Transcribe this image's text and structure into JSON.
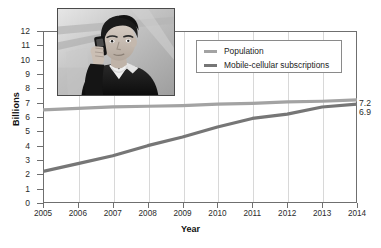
{
  "chart_data": {
    "type": "line",
    "title": "",
    "xlabel": "Year",
    "ylabel": "Billions",
    "x": [
      2005,
      2006,
      2007,
      2008,
      2009,
      2010,
      2011,
      2012,
      2013,
      2014
    ],
    "xtick_labels": [
      "2005",
      "2006",
      "2007",
      "2008",
      "2009",
      "2010",
      "2011",
      "2012",
      "2013",
      "2014"
    ],
    "ytick_labels": [
      "0",
      "1",
      "2",
      "3",
      "4",
      "5",
      "6",
      "7",
      "8",
      "9",
      "10",
      "11",
      "12"
    ],
    "ylim": [
      0,
      12
    ],
    "xlim": [
      2005,
      2014
    ],
    "grid": "vertical",
    "legend_position": "top-right",
    "series": [
      {
        "name": "Population",
        "color": "#a3a3a3",
        "values": [
          6.5,
          6.6,
          6.7,
          6.75,
          6.8,
          6.9,
          6.95,
          7.05,
          7.1,
          7.2
        ],
        "end_label": "7.2"
      },
      {
        "name": "Mobile-cellular subscriptions",
        "color": "#767676",
        "values": [
          2.2,
          2.75,
          3.3,
          4.0,
          4.6,
          5.3,
          5.9,
          6.2,
          6.7,
          6.9
        ],
        "end_label": "6.9"
      }
    ],
    "annotations": [
      {
        "text": "7.2",
        "series": "Population",
        "at_x": 2014
      },
      {
        "text": "6.9",
        "series": "Mobile-cellular subscriptions",
        "at_x": 2014
      }
    ]
  },
  "legend": {
    "items": [
      {
        "label": "Population",
        "color": "#a3a3a3"
      },
      {
        "label": "Mobile-cellular subscriptions",
        "color": "#767676"
      }
    ]
  },
  "inset": {
    "name": "photo-man-using-mobile-phone",
    "description": "Grayscale photograph of a man holding a mobile phone to his ear"
  },
  "axes": {
    "y_title": "Billions",
    "x_title": "Year"
  }
}
